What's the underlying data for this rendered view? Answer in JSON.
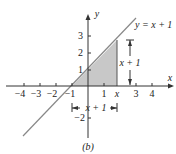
{
  "figure": {
    "caption": "(b)",
    "line_label": "y = x + 1",
    "height_label": "x + 1",
    "base_label": "x + 1",
    "axis_x_label": "x",
    "axis_y_label": "y",
    "x_ticks": [
      "−4",
      "−3",
      "−2",
      "−1",
      "1",
      "x",
      "3",
      "4"
    ],
    "y_ticks": [
      "1",
      "2",
      "3",
      "−2"
    ],
    "colors": {
      "line": "#888888",
      "shade": "#c8c8c8",
      "axis": "#333333"
    }
  }
}
